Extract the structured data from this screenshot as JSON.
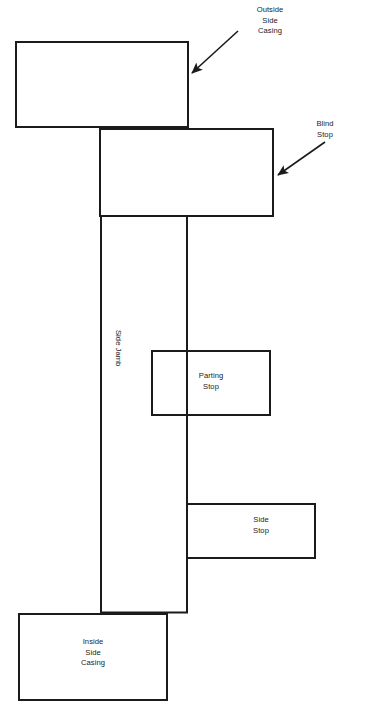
{
  "diagram": {
    "background_color": "#ffffff",
    "stroke_color": "#1b1b1b",
    "text_color": "#1b1b1b",
    "stroke_width": 2,
    "width": 366,
    "height": 714,
    "parts": [
      {
        "id": "outside-side-casing",
        "label": "Outside\nSide\nCasing",
        "label_placement": "callout",
        "x": 16,
        "y": 42,
        "w": 172,
        "h": 85
      },
      {
        "id": "blind-stop",
        "label": "Blind\nStop",
        "label_placement": "callout",
        "x": 100,
        "y": 129,
        "w": 173,
        "h": 87
      },
      {
        "id": "side-jamb",
        "label": "Side Jamb",
        "label_placement": "inside-rotated",
        "x": 101,
        "y": 216,
        "w": 86,
        "h": 396
      },
      {
        "id": "parting-stop",
        "label": "Parting\nStop",
        "label_placement": "inside",
        "x": 152,
        "y": 351,
        "w": 118,
        "h": 64
      },
      {
        "id": "side-stop",
        "label": "Side\nStop",
        "label_placement": "inside",
        "x": 187,
        "y": 504,
        "w": 128,
        "h": 54
      },
      {
        "id": "inside-side-casing",
        "label": "Inside\nSide\nCasing",
        "label_placement": "inside",
        "x": 19,
        "y": 614,
        "w": 148,
        "h": 86
      }
    ],
    "callouts": [
      {
        "id": "outside-side-casing-callout",
        "text": "Outside\nSide\nCasing",
        "text_x": 240,
        "text_y": 5,
        "text_align": "center",
        "text_width": 60,
        "arrow_from_x": 238,
        "arrow_from_y": 31,
        "arrow_to_x": 189,
        "arrow_to_y": 76
      },
      {
        "id": "blind-stop-callout",
        "text": "Blind\nStop",
        "text_x": 325,
        "text_y": 119,
        "text_align": "center",
        "text_width": 40,
        "arrow_from_x": 325,
        "arrow_from_y": 142,
        "arrow_to_x": 274,
        "arrow_to_y": 178
      }
    ],
    "inside_labels": [
      {
        "id": "parting-stop-text",
        "text": "Parting\nStop",
        "x": 181,
        "y": 371,
        "w": 60
      },
      {
        "id": "side-stop-text",
        "text": "Side\nStop",
        "x": 237,
        "y": 515,
        "w": 48
      },
      {
        "id": "inside-side-casing-text",
        "text": "Inside\nSide\nCasing",
        "x": 64,
        "y": 637,
        "w": 58
      }
    ],
    "rotated_labels": [
      {
        "id": "side-jamb-text",
        "text": "Side Jamb",
        "x": 123,
        "y": 330
      }
    ]
  }
}
